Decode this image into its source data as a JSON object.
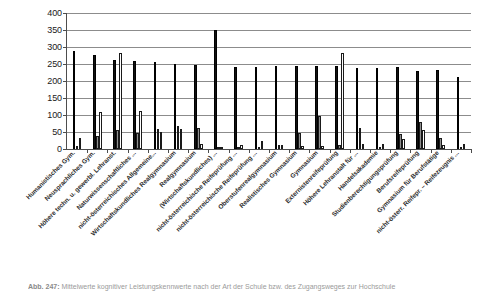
{
  "chart_data": {
    "type": "bar",
    "title": "",
    "subtitle": "",
    "xlabel": "",
    "ylabel": "",
    "ylim": [
      0,
      400
    ],
    "ytick_step": 50,
    "yticks": [
      400,
      350,
      300,
      250,
      200,
      150,
      100,
      50,
      0
    ],
    "grid": true,
    "legend_position": "none",
    "orientation": "vertical",
    "categories": [
      "Humanistisches Gym.",
      "Neusprachliches Gym.",
      "Höhere techn. u. gewerbl. Lehranst.",
      "Naturwissenschaftliches ...",
      "nicht-österreichisches Allgemeine...",
      "Wirtschaftskundliches Realgymnasium",
      "Realgymnasium",
      "(Wirtschaftskundliches) ...",
      "nicht-österreichische Reifeprüfung ...",
      "nicht-österreichische Reifeprüfung ...",
      "Oberstufenrealgymnasium",
      "Realistisches Gymnasium",
      "Gymnasium",
      "Externistenreifeprüfung",
      "Höhere Lehranstalt für ...",
      "Handelsakademie",
      "Studienberechtigungsprüfung",
      "Berufsreifeprüfung",
      "Gymnasium für Berufstätige",
      "nicht-österr. Reifepr. – Reifezeugnis ..."
    ],
    "series": [
      {
        "name": "series-1",
        "color": "#111111",
        "values": [
          288,
          277,
          263,
          259,
          255,
          250,
          248,
          350,
          240,
          241,
          243,
          244,
          245,
          243,
          239,
          239,
          241,
          228,
          231,
          212
        ]
      },
      {
        "name": "series-2",
        "color": "#8f8f8f",
        "values": [
          8,
          38,
          57,
          48,
          59,
          68,
          61,
          6,
          5,
          6,
          12,
          47,
          97,
          11,
          61,
          4,
          45,
          80,
          32,
          7
        ]
      },
      {
        "name": "series-3",
        "color": "#ffffff",
        "values": [
          31,
          110,
          281,
          111,
          50,
          58,
          14,
          2,
          12,
          25,
          13,
          8,
          9,
          282,
          14,
          16,
          30,
          55,
          11,
          14
        ]
      }
    ]
  },
  "caption": {
    "number": "Abb. 247:",
    "text": "Mittelwerte kognitiver Leistungskennwerte nach der Art der Schule bzw. des Zugangsweges zur Hochschule"
  }
}
